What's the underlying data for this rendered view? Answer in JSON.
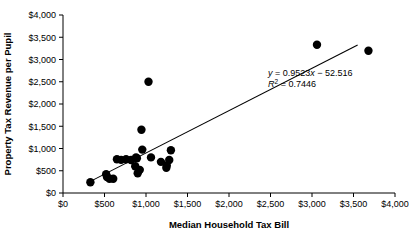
{
  "chart_data": {
    "type": "scatter",
    "title": "",
    "xlabel": "Median Household Tax Bill",
    "ylabel": "Property Tax Revenue per Pupil",
    "xlim": [
      0,
      4000
    ],
    "ylim": [
      0,
      4000
    ],
    "grid": false,
    "legend": null,
    "xticks": [
      0,
      500,
      1000,
      1500,
      2000,
      2500,
      3000,
      3500,
      4000
    ],
    "yticks": [
      0,
      500,
      1000,
      1500,
      2000,
      2500,
      3000,
      3500,
      4000
    ],
    "xticklabels": [
      "$0",
      "$500",
      "$1,000",
      "$1,500",
      "$2,000",
      "$2,500",
      "$3,000",
      "$3,500",
      "$4,000"
    ],
    "yticklabels": [
      "$0",
      "$500",
      "$1,000",
      "$1,500",
      "$2,000",
      "$2,500",
      "$3,000",
      "$3,500",
      "$4,000"
    ],
    "points": [
      [
        330,
        240
      ],
      [
        520,
        420
      ],
      [
        530,
        360
      ],
      [
        560,
        320
      ],
      [
        605,
        320
      ],
      [
        650,
        760
      ],
      [
        700,
        745
      ],
      [
        760,
        760
      ],
      [
        820,
        740
      ],
      [
        870,
        600
      ],
      [
        880,
        800
      ],
      [
        890,
        780
      ],
      [
        900,
        445
      ],
      [
        925,
        520
      ],
      [
        945,
        1420
      ],
      [
        955,
        975
      ],
      [
        1030,
        2500
      ],
      [
        1060,
        800
      ],
      [
        1180,
        700
      ],
      [
        1245,
        565
      ],
      [
        1250,
        620
      ],
      [
        1280,
        740
      ],
      [
        1300,
        960
      ],
      [
        3060,
        3330
      ],
      [
        3680,
        3195
      ]
    ],
    "regression": {
      "equation_line1": "y = 0.9523x − 52.516",
      "equation_line2": "R² = 0.7446",
      "slope": 0.9523,
      "intercept": -52.516,
      "r_squared": 0.7446,
      "x_start": 300,
      "x_end": 3550
    },
    "marker": {
      "shape": "circle",
      "color": "#000000",
      "size": 4.2
    },
    "annotation_position": "middle-right"
  }
}
